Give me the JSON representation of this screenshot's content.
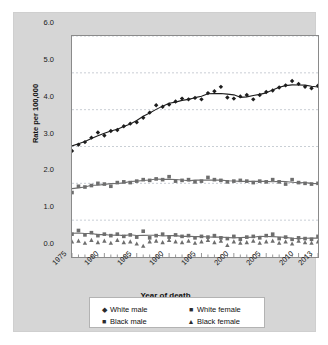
{
  "chart_data": {
    "type": "scatter",
    "title": "",
    "xlabel": "Year of death",
    "ylabel": "Rate per 100,000",
    "xlim": [
      1975,
      2013
    ],
    "ylim": [
      0.0,
      6.0
    ],
    "grid": true,
    "legend_position": "bottom",
    "x_tick_labels": [
      "1975",
      "1980",
      "1985",
      "1990",
      "1995",
      "2000",
      "2005",
      "2010",
      "2013"
    ],
    "x_tick_values": [
      1975,
      1980,
      1985,
      1990,
      1995,
      2000,
      2005,
      2010,
      2013
    ],
    "y_tick_labels": [
      "0.0",
      "1.0",
      "2.0",
      "3.0",
      "4.0",
      "5.0",
      "6.0"
    ],
    "y_tick_values": [
      0.0,
      1.0,
      2.0,
      3.0,
      4.0,
      5.0,
      6.0
    ],
    "x": [
      1975,
      1976,
      1977,
      1978,
      1979,
      1980,
      1981,
      1982,
      1983,
      1984,
      1985,
      1986,
      1987,
      1988,
      1989,
      1990,
      1991,
      1992,
      1993,
      1994,
      1995,
      1996,
      1997,
      1998,
      1999,
      2000,
      2001,
      2002,
      2003,
      2004,
      2005,
      2006,
      2007,
      2008,
      2009,
      2010,
      2011,
      2012,
      2013
    ],
    "series": [
      {
        "name": "White male",
        "marker": "diamond",
        "color": "#1d1d1d",
        "trend": true,
        "values": [
          2.88,
          3.05,
          3.12,
          3.24,
          3.38,
          3.3,
          3.42,
          3.45,
          3.55,
          3.62,
          3.66,
          3.78,
          3.92,
          4.12,
          4.08,
          4.14,
          4.22,
          4.3,
          4.28,
          4.32,
          4.28,
          4.45,
          4.5,
          4.62,
          4.33,
          4.3,
          4.36,
          4.4,
          4.28,
          4.4,
          4.48,
          4.52,
          4.6,
          4.66,
          4.78,
          4.7,
          4.62,
          4.58,
          4.65
        ]
      },
      {
        "name": "Black male",
        "marker": "square",
        "color": "#6e6e6e",
        "trend": true,
        "values": [
          1.75,
          1.92,
          1.9,
          1.94,
          2.0,
          1.98,
          1.92,
          2.02,
          2.04,
          2.02,
          2.06,
          2.1,
          2.08,
          2.12,
          2.1,
          2.18,
          2.06,
          2.08,
          2.1,
          2.04,
          2.06,
          2.16,
          2.1,
          2.08,
          2.04,
          2.06,
          2.08,
          2.06,
          2.02,
          2.06,
          2.04,
          2.1,
          2.04,
          1.98,
          2.1,
          2.02,
          2.0,
          1.98,
          2.0
        ]
      },
      {
        "name": "White female",
        "marker": "square",
        "color": "#6e6e6e",
        "trend": true,
        "values": [
          0.62,
          0.72,
          0.6,
          0.66,
          0.58,
          0.62,
          0.58,
          0.62,
          0.56,
          0.6,
          0.54,
          0.7,
          0.52,
          0.58,
          0.62,
          0.54,
          0.6,
          0.56,
          0.58,
          0.52,
          0.56,
          0.54,
          0.58,
          0.52,
          0.5,
          0.56,
          0.48,
          0.54,
          0.56,
          0.52,
          0.58,
          0.62,
          0.5,
          0.54,
          0.48,
          0.52,
          0.5,
          0.48,
          0.56
        ]
      },
      {
        "name": "Black female",
        "marker": "triangle",
        "color": "#6e6e6e",
        "trend": false,
        "values": [
          0.42,
          0.44,
          0.38,
          0.46,
          0.4,
          0.44,
          0.38,
          0.46,
          0.4,
          0.42,
          0.36,
          0.3,
          0.42,
          0.44,
          0.4,
          0.46,
          0.42,
          0.4,
          0.44,
          0.38,
          0.42,
          0.46,
          0.4,
          0.44,
          0.32,
          0.42,
          0.38,
          0.4,
          0.44,
          0.38,
          0.42,
          0.44,
          0.38,
          0.42,
          0.36,
          0.44,
          0.4,
          0.38,
          0.42
        ]
      }
    ],
    "legend": [
      {
        "label": "White male",
        "marker": "◆"
      },
      {
        "label": "White female",
        "marker": "■"
      },
      {
        "label": "Black male",
        "marker": "■"
      },
      {
        "label": "Black female",
        "marker": "▲"
      }
    ],
    "colors": {
      "panel_background": "#d6d6d6",
      "plot_background": "#ffffff",
      "axis": "#8a8a8a",
      "grid": "#9aa3b0",
      "series_dark": "#1d1d1d",
      "series_grey": "#6e6e6e"
    }
  }
}
